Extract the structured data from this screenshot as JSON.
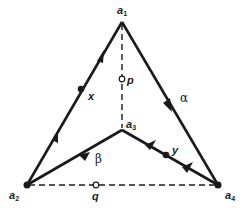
{
  "diagram": {
    "type": "graph",
    "vertices": [
      {
        "id": "a1",
        "label": "a",
        "sub": "1",
        "x": 122,
        "y": 22
      },
      {
        "id": "a2",
        "label": "a",
        "sub": "2",
        "x": 27,
        "y": 185
      },
      {
        "id": "a3",
        "label": "a",
        "sub": "3",
        "x": 122,
        "y": 130
      },
      {
        "id": "a4",
        "label": "a",
        "sub": "4",
        "x": 218,
        "y": 185
      }
    ],
    "points": [
      {
        "id": "x",
        "label": "x",
        "kind": "filled"
      },
      {
        "id": "y",
        "label": "y",
        "kind": "filled"
      },
      {
        "id": "p",
        "label": "p",
        "kind": "hollow"
      },
      {
        "id": "q",
        "label": "q",
        "kind": "hollow"
      }
    ],
    "paths": [
      {
        "label": "α",
        "route": "a1 → a4 → a3"
      },
      {
        "label": "β",
        "route": "a3 → a2 → a1"
      }
    ],
    "dashed_edges": [
      "a1–a3",
      "a2–a4"
    ],
    "colors": {
      "stroke": "#1a1a1a",
      "background": "#ffffff"
    }
  }
}
